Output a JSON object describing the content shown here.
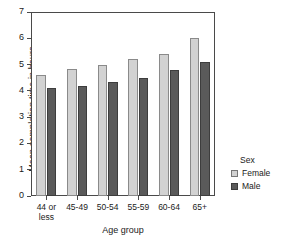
{
  "chart_data": {
    "type": "bar",
    "title": "",
    "xlabel": "Age group",
    "ylabel": "Mean completion time in hours",
    "categories": [
      "44 or\nless",
      "45-49",
      "50-54",
      "55-59",
      "60-64",
      "65+"
    ],
    "ylim": [
      0,
      7
    ],
    "yticks": [
      0,
      1,
      2,
      3,
      4,
      5,
      6,
      7
    ],
    "grid": false,
    "legend": {
      "title": "Sex",
      "position": "right",
      "entries": [
        "Female",
        "Male"
      ]
    },
    "series": [
      {
        "name": "Female",
        "color": "#d2d2d2",
        "values": [
          4.6,
          4.85,
          5.0,
          5.2,
          5.4,
          6.0
        ]
      },
      {
        "name": "Male",
        "color": "#5a5a5a",
        "values": [
          4.1,
          4.2,
          4.35,
          4.5,
          4.8,
          5.1
        ]
      }
    ]
  }
}
